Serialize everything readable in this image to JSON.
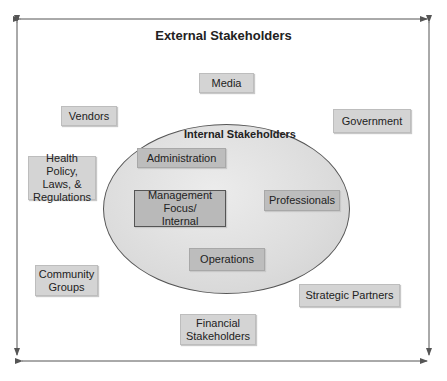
{
  "diagram": {
    "outer_title": "External Stakeholders",
    "inner_title": "Internal Stakeholders",
    "external_stakeholders": [
      {
        "id": "media",
        "label": "Media"
      },
      {
        "id": "vendors",
        "label": "Vendors"
      },
      {
        "id": "government",
        "label": "Government"
      },
      {
        "id": "health-policy",
        "label": "Health Policy,\nLaws, &\nRegulations"
      },
      {
        "id": "community-groups",
        "label": "Community\nGroups"
      },
      {
        "id": "strategic-partners",
        "label": "Strategic Partners"
      },
      {
        "id": "financial-stakeholders",
        "label": "Financial\nStakeholders"
      }
    ],
    "internal_stakeholders": [
      {
        "id": "administration",
        "label": "Administration"
      },
      {
        "id": "management-focus",
        "label": "Management Focus/\nInternal"
      },
      {
        "id": "professionals",
        "label": "Professionals"
      },
      {
        "id": "operations",
        "label": "Operations"
      }
    ],
    "colors": {
      "box_fill": "#d4d4d4",
      "inner_box_fill": "#b9b9b9",
      "ellipse_fill": "#dcdcdc",
      "line": "#555555"
    }
  }
}
